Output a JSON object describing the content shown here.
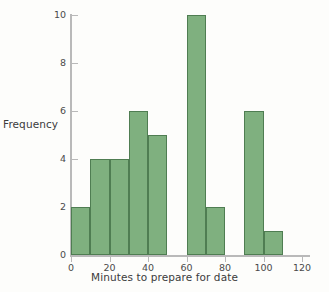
{
  "chart_data": {
    "type": "bar",
    "title": "",
    "subtitle": "",
    "xlabel": "Minutes to prepare for date",
    "ylabel": "Frequency",
    "bin_width": 10,
    "bin_starts": [
      0,
      10,
      20,
      30,
      40,
      50,
      60,
      70,
      80,
      90,
      100,
      110
    ],
    "categories": [
      "0-10",
      "10-20",
      "20-30",
      "30-40",
      "40-50",
      "50-60",
      "60-70",
      "70-80",
      "80-90",
      "90-100",
      "100-110",
      "110-120"
    ],
    "values": [
      2,
      4,
      4,
      6,
      5,
      0,
      10,
      2,
      0,
      6,
      1,
      0
    ],
    "xlim": [
      0,
      125
    ],
    "ylim": [
      0,
      10.6
    ],
    "xticks": [
      0,
      20,
      40,
      60,
      80,
      100,
      120
    ],
    "xtick_labels": [
      "0",
      "20",
      "40",
      "60",
      "80",
      "100",
      "120"
    ],
    "yticks": [
      0,
      2,
      4,
      6,
      8,
      10
    ],
    "ytick_labels": [
      "0",
      "2",
      "4",
      "6",
      "8",
      "10"
    ],
    "grid": false,
    "legend": null,
    "bar_color": "#7fb07f",
    "bar_edge_color": "#4f7d52",
    "axis_color": "#b9b9b9",
    "background_color": "#fdfdfb"
  }
}
